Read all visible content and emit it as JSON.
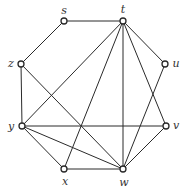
{
  "diagram": {
    "type": "undirected-graph",
    "nodes": [
      {
        "id": "s",
        "label": "s",
        "x": 64,
        "y": 21,
        "lx": 64,
        "ly": 11
      },
      {
        "id": "t",
        "label": "t",
        "x": 123,
        "y": 21,
        "lx": 123,
        "ly": 10
      },
      {
        "id": "z",
        "label": "z",
        "x": 21,
        "y": 64,
        "lx": 11,
        "ly": 64
      },
      {
        "id": "u",
        "label": "u",
        "x": 165,
        "y": 64,
        "lx": 176,
        "ly": 64
      },
      {
        "id": "y",
        "label": "y",
        "x": 22,
        "y": 126,
        "lx": 11,
        "ly": 127
      },
      {
        "id": "v",
        "label": "v",
        "x": 166,
        "y": 126,
        "lx": 176,
        "ly": 126
      },
      {
        "id": "x",
        "label": "x",
        "x": 64,
        "y": 169,
        "lx": 65,
        "ly": 182
      },
      {
        "id": "w",
        "label": "w",
        "x": 123,
        "y": 169,
        "lx": 124,
        "ly": 183
      }
    ],
    "edges": [
      [
        "s",
        "t"
      ],
      [
        "s",
        "z"
      ],
      [
        "z",
        "y"
      ],
      [
        "z",
        "w"
      ],
      [
        "t",
        "y"
      ],
      [
        "t",
        "x"
      ],
      [
        "t",
        "w"
      ],
      [
        "t",
        "v"
      ],
      [
        "t",
        "u"
      ],
      [
        "u",
        "w"
      ],
      [
        "y",
        "v"
      ],
      [
        "y",
        "x"
      ],
      [
        "y",
        "w"
      ],
      [
        "x",
        "w"
      ],
      [
        "v",
        "w"
      ]
    ]
  }
}
